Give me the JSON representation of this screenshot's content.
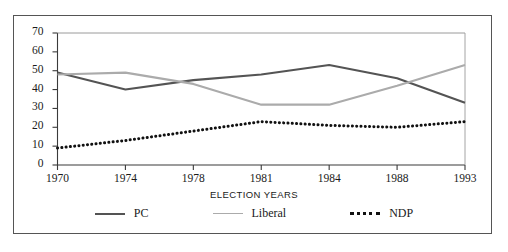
{
  "chart_data": {
    "type": "line",
    "title": "",
    "xlabel": "ELECTION YEARS",
    "ylabel": "",
    "categories": [
      "1970",
      "1974",
      "1978",
      "1981",
      "1984",
      "1988",
      "1993"
    ],
    "x_tick_labels": [
      "1970",
      "1974",
      "1978",
      "1981",
      "1984",
      "1988",
      "1993"
    ],
    "y_tick_labels": [
      "0",
      "10",
      "20",
      "30",
      "40",
      "50",
      "60",
      "70"
    ],
    "y_ticks": [
      0,
      10,
      20,
      30,
      40,
      50,
      60,
      70
    ],
    "ylim": [
      0,
      70
    ],
    "grid": false,
    "legend_position": "bottom",
    "series": [
      {
        "name": "PC",
        "color": "#545454",
        "style": "solid",
        "values": [
          49,
          40,
          45,
          48,
          53,
          46,
          33
        ]
      },
      {
        "name": "Liberal",
        "color": "#ababab",
        "style": "solid",
        "values": [
          48,
          49,
          43,
          32,
          32,
          42,
          53
        ]
      },
      {
        "name": "NDP",
        "color": "#111111",
        "style": "dotted",
        "values": [
          9,
          13,
          18,
          23,
          21,
          20,
          23
        ]
      }
    ]
  },
  "legend": {
    "items": [
      {
        "label": "PC",
        "swatch": "pc-line-swatch"
      },
      {
        "label": "Liberal",
        "swatch": "liberal-line-swatch"
      },
      {
        "label": "NDP",
        "swatch": "ndp-line-swatch"
      }
    ]
  },
  "axis_title": "ELECTION YEARS"
}
